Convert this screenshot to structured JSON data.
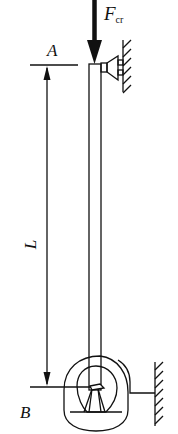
{
  "diagram": {
    "type": "column buckling schematic",
    "labels": {
      "force": "F",
      "force_subscript": "cr",
      "top_point": "A",
      "bottom_point": "B",
      "length": "L"
    },
    "colors": {
      "stroke": "#111111",
      "background": "#ffffff"
    },
    "elements": [
      {
        "name": "column",
        "description": "slender vertical bar"
      },
      {
        "name": "axial-load-arrow",
        "description": "downward force at top"
      },
      {
        "name": "top-roller-support",
        "description": "lateral support against hatched wall"
      },
      {
        "name": "bottom-clamp-support",
        "description": "rounded clamp fixed to hatched wall"
      },
      {
        "name": "length-dimension",
        "description": "dimension arrow from A to B"
      }
    ]
  }
}
